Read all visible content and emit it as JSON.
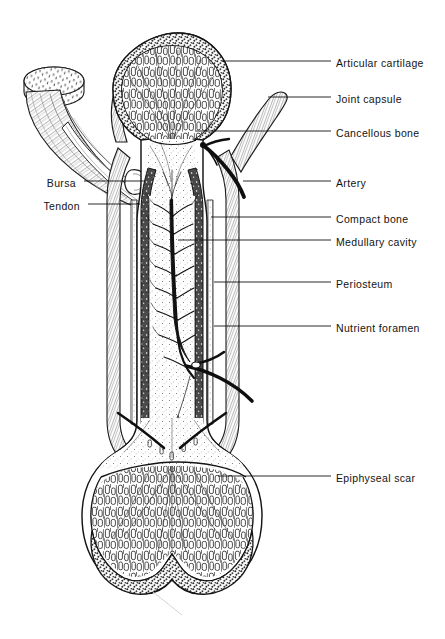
{
  "figure": {
    "background_color": "#ffffff",
    "ink_color": "#131313",
    "width": 445,
    "height": 639
  },
  "labels_right": [
    {
      "id": "articular-cartilage",
      "text": "Articular cartilage",
      "text_x": 336,
      "text_y": 57,
      "leader_x1": 222,
      "leader_x2": 331,
      "leader_y": 61,
      "target_x": 222,
      "target_y": 61
    },
    {
      "id": "joint-capsule",
      "text": "Joint capsule",
      "text_x": 336,
      "text_y": 93,
      "leader_x1": 268,
      "leader_x2": 331,
      "leader_y": 97,
      "target_x": 268,
      "target_y": 97
    },
    {
      "id": "cancellous-bone",
      "text": "Cancellous bone",
      "text_x": 336,
      "text_y": 127,
      "leader_x1": 196,
      "leader_x2": 331,
      "leader_y": 131,
      "target_x": 196,
      "target_y": 131
    },
    {
      "id": "artery",
      "text": "Artery",
      "text_x": 336,
      "text_y": 177,
      "leader_x1": 243,
      "leader_x2": 331,
      "leader_y": 181,
      "target_x": 243,
      "target_y": 181
    },
    {
      "id": "compact-bone",
      "text": "Compact bone",
      "text_x": 336,
      "text_y": 213,
      "leader_x1": 211,
      "leader_x2": 331,
      "leader_y": 217,
      "target_x": 211,
      "target_y": 217
    },
    {
      "id": "medullary-cavity",
      "text": "Medullary cavity",
      "text_x": 336,
      "text_y": 236,
      "leader_x1": 178,
      "leader_x2": 331,
      "leader_y": 240,
      "target_x": 178,
      "target_y": 240
    },
    {
      "id": "periosteum",
      "text": "Periosteum",
      "text_x": 336,
      "text_y": 278,
      "leader_x1": 214,
      "leader_x2": 331,
      "leader_y": 282,
      "target_x": 214,
      "target_y": 282
    },
    {
      "id": "nutrient-foramen",
      "text": "Nutrient foramen",
      "text_x": 336,
      "text_y": 322,
      "leader_x1": 214,
      "leader_x2": 331,
      "leader_y": 326,
      "target_x": 214,
      "target_y": 326
    },
    {
      "id": "epiphyseal-scar",
      "text": "Epiphyseal scar",
      "text_x": 336,
      "text_y": 472,
      "leader_x1": 218,
      "leader_x2": 331,
      "leader_y": 476,
      "target_x": 218,
      "target_y": 476
    }
  ],
  "labels_left": [
    {
      "id": "bursa",
      "text": "Bursa",
      "text_right_x": 76,
      "text_y": 177,
      "leader_x1": 84,
      "leader_x2": 144,
      "leader_y": 181,
      "target_x": 144,
      "target_y": 181
    },
    {
      "id": "tendon",
      "text": "Tendon",
      "text_right_x": 80,
      "text_y": 200,
      "leader_x1": 88,
      "leader_x2": 140,
      "leader_y": 204,
      "target_x": 140,
      "target_y": 204
    }
  ],
  "structures": [
    {
      "id": "proximal-epiphysis",
      "name": "Proximal epiphysis (head)"
    },
    {
      "id": "articular-cartilage-cap",
      "name": "Articular cartilage",
      "texture": "stippled"
    },
    {
      "id": "cancellous-bone-head",
      "name": "Cancellous (spongy) bone",
      "texture": "trabecular"
    },
    {
      "id": "epiphyseal-line-proximal",
      "name": "Epiphyseal scar (proximal)"
    },
    {
      "id": "diaphysis",
      "name": "Diaphysis (shaft)"
    },
    {
      "id": "compact-bone-wall",
      "name": "Compact bone wall",
      "texture": "dense-lacunae"
    },
    {
      "id": "medullary-cavity-space",
      "name": "Medullary cavity",
      "texture": "fine-stipple"
    },
    {
      "id": "nutrient-artery",
      "name": "Nutrient artery",
      "texture": "branching"
    },
    {
      "id": "periosteum-layer",
      "name": "Periosteum"
    },
    {
      "id": "joint-capsule-band",
      "name": "Joint capsule"
    },
    {
      "id": "tendon-muscle",
      "name": "Tendon and cut muscle belly"
    },
    {
      "id": "bursa-sac",
      "name": "Bursa"
    },
    {
      "id": "distal-epiphysis",
      "name": "Distal epiphysis (condyles)"
    },
    {
      "id": "epiphyseal-line-distal",
      "name": "Epiphyseal scar (distal)"
    }
  ]
}
